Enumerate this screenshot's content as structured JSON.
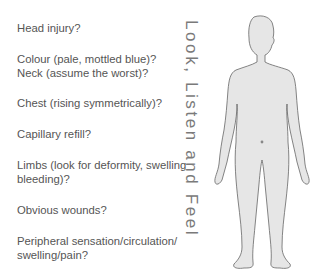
{
  "checklist": [
    {
      "text": "Head injury?"
    },
    {
      "text": "Colour (pale, mottled blue)?"
    },
    {
      "text": "Neck (assume the worst)?"
    },
    {
      "text": "Chest (rising symmetrically)?"
    },
    {
      "text": "Capillary refill?"
    },
    {
      "text": "Limbs (look for deformity, swelling"
    },
    {
      "text": "bleeding)?"
    },
    {
      "text": "Obvious wounds?"
    },
    {
      "text": "Peripheral sensation/circulation/"
    },
    {
      "text": "swelling/pain?"
    }
  ],
  "vertical_label": "Look, Listen and Feel",
  "figure": {
    "icon": "human-body-silhouette",
    "fill": "#e6e6e6",
    "stroke": "#666666"
  }
}
